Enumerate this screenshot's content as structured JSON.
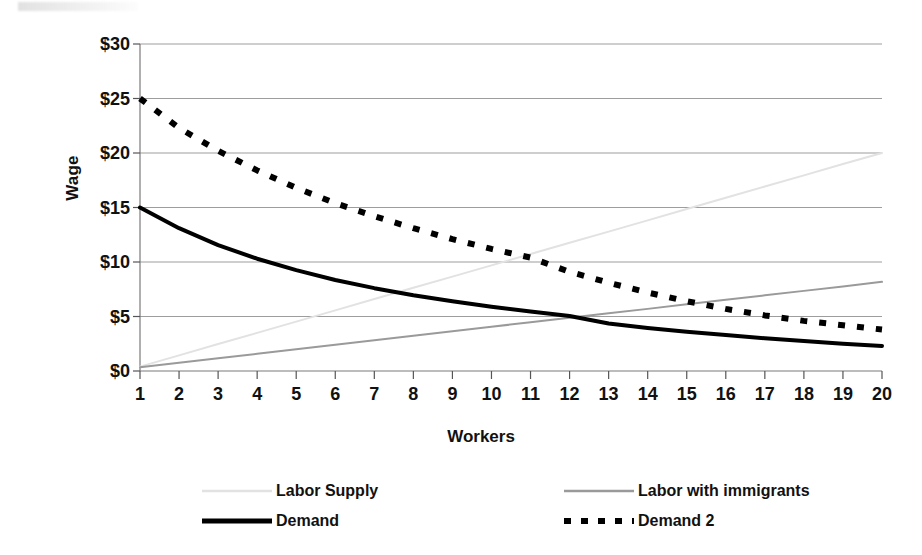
{
  "chart_data": {
    "type": "line",
    "title": "",
    "xlabel": "Workers",
    "ylabel": "Wage",
    "xlim": [
      1,
      20
    ],
    "ylim": [
      0,
      30
    ],
    "grid": true,
    "legend_position": "bottom",
    "x": [
      1,
      2,
      3,
      4,
      5,
      6,
      7,
      8,
      9,
      10,
      11,
      12,
      13,
      14,
      15,
      16,
      17,
      18,
      19,
      20
    ],
    "xtick_labels": [
      "1",
      "2",
      "3",
      "4",
      "5",
      "6",
      "7",
      "8",
      "9",
      "10",
      "11",
      "12",
      "13",
      "14",
      "15",
      "16",
      "17",
      "18",
      "19",
      "20"
    ],
    "ytick_labels": [
      "$0",
      "$5",
      "$10",
      "$15",
      "$20",
      "$25",
      "$30"
    ],
    "ytick_values": [
      0,
      5,
      10,
      15,
      20,
      25,
      30
    ],
    "series": [
      {
        "name": "Labor Supply",
        "style": "solid",
        "color": "#e2e2e2",
        "width": 2,
        "values": [
          0.4,
          1.43,
          2.47,
          3.5,
          4.53,
          5.56,
          6.6,
          7.63,
          8.66,
          9.69,
          10.73,
          11.76,
          12.79,
          13.82,
          14.86,
          15.89,
          16.92,
          17.95,
          18.99,
          20.0
        ]
      },
      {
        "name": "Labor with immigrants",
        "style": "solid",
        "color": "#9a9a9a",
        "width": 2,
        "values": [
          0.35,
          0.76,
          1.17,
          1.58,
          2.0,
          2.41,
          2.82,
          3.23,
          3.64,
          4.06,
          4.47,
          4.88,
          5.29,
          5.7,
          6.12,
          6.53,
          6.94,
          7.35,
          7.76,
          8.18
        ]
      },
      {
        "name": "Demand",
        "style": "solid",
        "color": "#000000",
        "width": 4,
        "values": [
          15.0,
          13.1,
          11.55,
          10.3,
          9.25,
          8.35,
          7.6,
          6.95,
          6.4,
          5.9,
          5.45,
          5.05,
          4.35,
          3.95,
          3.6,
          3.3,
          3.0,
          2.75,
          2.5,
          2.3
        ]
      },
      {
        "name": "Demand 2",
        "style": "dashed",
        "color": "#000000",
        "width": 6,
        "values": [
          25.0,
          22.3,
          20.2,
          18.4,
          16.8,
          15.4,
          14.2,
          13.1,
          12.1,
          11.2,
          10.4,
          9.1,
          8.1,
          7.2,
          6.4,
          5.7,
          5.1,
          4.6,
          4.2,
          3.8
        ]
      }
    ]
  },
  "legend": {
    "entries": [
      {
        "label": "Labor Supply",
        "swatch": "light-gray-line-swatch"
      },
      {
        "label": "Labor with immigrants",
        "swatch": "gray-line-swatch"
      },
      {
        "label": "Demand",
        "swatch": "black-solid-line-swatch"
      },
      {
        "label": "Demand 2",
        "swatch": "black-dashed-line-swatch"
      }
    ]
  }
}
